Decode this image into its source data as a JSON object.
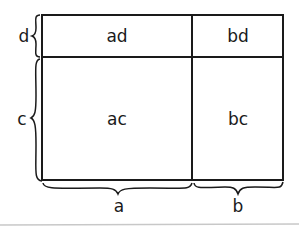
{
  "diagram": {
    "cells": {
      "ad": "ad",
      "bd": "bd",
      "ac": "ac",
      "bc": "bc"
    },
    "side_labels": {
      "d": "d",
      "c": "c",
      "a": "a",
      "b": "b"
    },
    "colors": {
      "stroke": "#1a1a1a",
      "background": "#ffffff",
      "rule": "#c8c8c8"
    }
  }
}
